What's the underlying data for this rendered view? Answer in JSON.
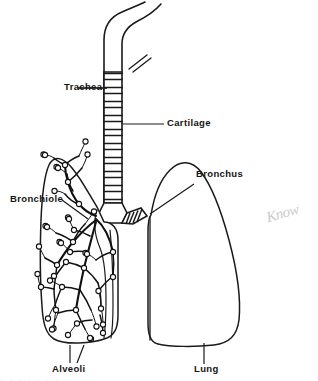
{
  "figure": {
    "background_color": "#ffffff",
    "ink_color": "#1a1a1a",
    "pencil_color": "#c9c9c9"
  },
  "labels": {
    "trachea": "Trachea",
    "cartilage": "Cartilage",
    "bronchiole": "Bronchiole",
    "bronchus": "Bronchus",
    "alveoli": "Alveoli",
    "lung": "Lung"
  },
  "annotations": {
    "handwritten_note": "Know",
    "bottom_edge_smudge": "· · · · · · · ·"
  },
  "structures": {
    "trachea_ring_count": 16,
    "left_lung_detail": "bronchial tree with alveoli",
    "right_lung_detail": "plain outline"
  }
}
